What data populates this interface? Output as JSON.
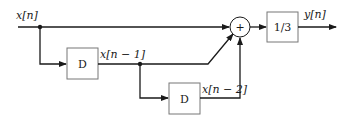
{
  "diagram": {
    "type": "block-diagram",
    "input_label": "x[n]",
    "output_label": "y[n]",
    "delay1": {
      "label": "D",
      "output_label": "x[n − 1]"
    },
    "delay2": {
      "label": "D",
      "output_label": "x[n − 2]"
    },
    "summer": {
      "symbol": "+"
    },
    "gain": {
      "label": "1/3"
    },
    "colors": {
      "line": "#1a1a1a",
      "box_border": "#777777",
      "background": "#ffffff"
    }
  }
}
